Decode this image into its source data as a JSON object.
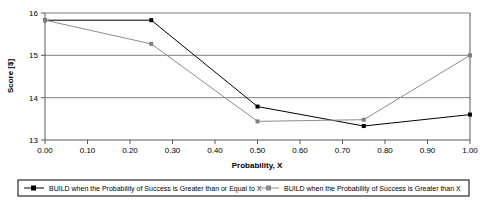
{
  "chart_data": {
    "type": "line",
    "title": "",
    "xlabel": "Probability, X",
    "ylabel": "Score [$]",
    "xlim": [
      0.0,
      1.0
    ],
    "ylim": [
      13,
      16
    ],
    "grid": true,
    "grid_axis": "y",
    "legend_position": "bottom",
    "x_ticks": [
      "0.00",
      "0.10",
      "0.20",
      "0.30",
      "0.40",
      "0.50",
      "0.60",
      "0.70",
      "0.80",
      "0.90",
      "1.00"
    ],
    "x_tick_values": [
      0.0,
      0.1,
      0.2,
      0.3,
      0.4,
      0.5,
      0.6,
      0.7,
      0.8,
      0.9,
      1.0
    ],
    "y_ticks": [
      "13",
      "14",
      "15",
      "16"
    ],
    "y_tick_values": [
      13,
      14,
      15,
      16
    ],
    "x": [
      0.0,
      0.25,
      0.5,
      0.75,
      1.0
    ],
    "series": [
      {
        "name": "BUILD when the Probability of Success is Greater than or Equal to X",
        "color": "#000000",
        "marker": "square",
        "values": [
          15.83,
          15.83,
          13.79,
          13.33,
          13.6
        ]
      },
      {
        "name": "BUILD when the Probability of Success is Greater than X",
        "color": "#808080",
        "marker": "square",
        "values": [
          15.83,
          15.27,
          13.44,
          13.48,
          15.0
        ]
      }
    ]
  },
  "legend": {
    "entries": [
      {
        "label": "BUILD when the Probability of Success is Greater than or Equal to X",
        "color": "#000000"
      },
      {
        "label": "BUILD when the Probability of Success is Greater than X",
        "color": "#808080"
      }
    ]
  },
  "axes": {
    "x_title": "Probability, X",
    "y_title": "Score [$]"
  }
}
